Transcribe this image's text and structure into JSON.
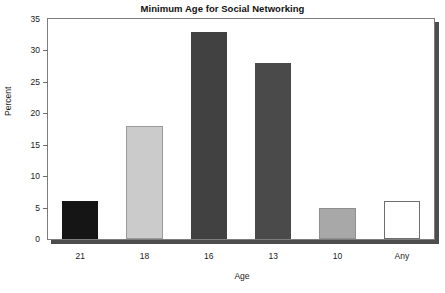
{
  "chart_data": {
    "type": "bar",
    "title": "Minimum Age for Social Networking",
    "xlabel": "Age",
    "ylabel": "Percent",
    "categories": [
      "21",
      "18",
      "16",
      "13",
      "10",
      "Any"
    ],
    "values": [
      6,
      18,
      33,
      28,
      5,
      6
    ],
    "bar_colors": [
      "#151515",
      "#cbcbcb",
      "#414141",
      "#4a4a4a",
      "#a8a8a8",
      "#ffffff"
    ],
    "bar_border_colors": [
      "#151515",
      "#9a9a9a",
      "#414141",
      "#4a4a4a",
      "#8f8f8f",
      "#6e6e6e"
    ],
    "ylim": [
      0,
      35
    ],
    "yticks": [
      0,
      5,
      10,
      15,
      20,
      25,
      30,
      35
    ],
    "ytick_labels": [
      "0",
      "5",
      "10",
      "15",
      "20",
      "25",
      "30",
      "35"
    ],
    "grid": false,
    "legend": "none",
    "frame_color": "#7d7d7d",
    "shadow_color": "#4d4d4d",
    "background": "#ffffff"
  }
}
